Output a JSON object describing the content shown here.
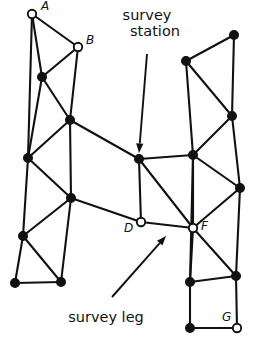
{
  "figure": {
    "background_color": "#ffffff",
    "ink_color": "#111111"
  },
  "callouts": [
    {
      "id": "survey-station",
      "line1": "survey",
      "line2": "station",
      "text_x": 147,
      "text_y1": 20,
      "text_y2": 36,
      "arrow_from_x": 147,
      "arrow_from_y": 54,
      "arrow_to_x": 139,
      "arrow_to_y": 153
    },
    {
      "id": "survey-leg",
      "line1": "survey leg",
      "line2": "",
      "text_x": 106,
      "text_y1": 322,
      "text_y2": 322,
      "arrow_from_x": 112,
      "arrow_from_y": 297,
      "arrow_to_x": 166,
      "arrow_to_y": 236
    }
  ],
  "nodes": [
    {
      "id": "A",
      "label": "A",
      "x": 32,
      "y": 14,
      "style": "open",
      "label_dx": 9,
      "label_dy": -4
    },
    {
      "id": "B",
      "label": "B",
      "x": 78,
      "y": 47,
      "style": "open",
      "label_dx": 8,
      "label_dy": -3
    },
    {
      "id": "D",
      "label": "D",
      "x": 141,
      "y": 222,
      "style": "open",
      "label_dx": -17,
      "label_dy": 10
    },
    {
      "id": "F",
      "label": "F",
      "x": 193,
      "y": 228,
      "style": "open",
      "label_dx": 8,
      "label_dy": 2
    },
    {
      "id": "G",
      "label": "G",
      "x": 237,
      "y": 328,
      "style": "open",
      "label_dx": -15,
      "label_dy": -7
    },
    {
      "id": "L1",
      "label": "",
      "x": 42,
      "y": 77,
      "style": "filled",
      "label_dx": 0,
      "label_dy": 0
    },
    {
      "id": "L2",
      "label": "",
      "x": 70,
      "y": 120,
      "style": "filled",
      "label_dx": 0,
      "label_dy": 0
    },
    {
      "id": "L3",
      "label": "",
      "x": 28,
      "y": 158,
      "style": "filled",
      "label_dx": 0,
      "label_dy": 0
    },
    {
      "id": "L4",
      "label": "",
      "x": 71,
      "y": 198,
      "style": "filled",
      "label_dx": 0,
      "label_dy": 0
    },
    {
      "id": "L5",
      "label": "",
      "x": 23,
      "y": 236,
      "style": "filled",
      "label_dx": 0,
      "label_dy": 0
    },
    {
      "id": "L6",
      "label": "",
      "x": 15,
      "y": 283,
      "style": "filled",
      "label_dx": 0,
      "label_dy": 0
    },
    {
      "id": "L7",
      "label": "",
      "x": 61,
      "y": 282,
      "style": "filled",
      "label_dx": 0,
      "label_dy": 0
    },
    {
      "id": "C",
      "label": "",
      "x": 139,
      "y": 159,
      "style": "filled",
      "label_dx": 0,
      "label_dy": 0
    },
    {
      "id": "R1",
      "label": "",
      "x": 234,
      "y": 35,
      "style": "filled",
      "label_dx": 0,
      "label_dy": 0
    },
    {
      "id": "R2",
      "label": "",
      "x": 186,
      "y": 61,
      "style": "filled",
      "label_dx": 0,
      "label_dy": 0
    },
    {
      "id": "R3",
      "label": "",
      "x": 232,
      "y": 116,
      "style": "filled",
      "label_dx": 0,
      "label_dy": 0
    },
    {
      "id": "R4",
      "label": "",
      "x": 193,
      "y": 155,
      "style": "filled",
      "label_dx": 0,
      "label_dy": 0
    },
    {
      "id": "R5",
      "label": "",
      "x": 240,
      "y": 188,
      "style": "filled",
      "label_dx": 0,
      "label_dy": 0
    },
    {
      "id": "R6",
      "label": "",
      "x": 236,
      "y": 276,
      "style": "filled",
      "label_dx": 0,
      "label_dy": 0
    },
    {
      "id": "R7",
      "label": "",
      "x": 190,
      "y": 282,
      "style": "filled",
      "label_dx": 0,
      "label_dy": 0
    },
    {
      "id": "R8",
      "label": "",
      "x": 190,
      "y": 328,
      "style": "filled",
      "label_dx": 0,
      "label_dy": 0
    }
  ],
  "legs": [
    [
      "A",
      "B"
    ],
    [
      "A",
      "L1"
    ],
    [
      "A",
      "L3"
    ],
    [
      "B",
      "L1"
    ],
    [
      "B",
      "L2"
    ],
    [
      "L1",
      "L2"
    ],
    [
      "L1",
      "L3"
    ],
    [
      "L2",
      "L3"
    ],
    [
      "L2",
      "L4"
    ],
    [
      "L2",
      "C"
    ],
    [
      "L3",
      "L4"
    ],
    [
      "L3",
      "L5"
    ],
    [
      "L4",
      "L5"
    ],
    [
      "L4",
      "L7"
    ],
    [
      "L4",
      "D"
    ],
    [
      "L5",
      "L6"
    ],
    [
      "L5",
      "L7"
    ],
    [
      "L6",
      "L7"
    ],
    [
      "C",
      "D"
    ],
    [
      "C",
      "F"
    ],
    [
      "C",
      "R4"
    ],
    [
      "D",
      "F"
    ],
    [
      "F",
      "R4"
    ],
    [
      "F",
      "R5"
    ],
    [
      "F",
      "R6"
    ],
    [
      "F",
      "R7"
    ],
    [
      "R1",
      "R2"
    ],
    [
      "R1",
      "R3"
    ],
    [
      "R2",
      "R3"
    ],
    [
      "R2",
      "R4"
    ],
    [
      "R3",
      "R4"
    ],
    [
      "R3",
      "R5"
    ],
    [
      "R4",
      "R5"
    ],
    [
      "R4",
      "R7"
    ],
    [
      "R5",
      "R6"
    ],
    [
      "R6",
      "R7"
    ],
    [
      "R6",
      "G"
    ],
    [
      "R7",
      "R8"
    ],
    [
      "R8",
      "G"
    ]
  ]
}
